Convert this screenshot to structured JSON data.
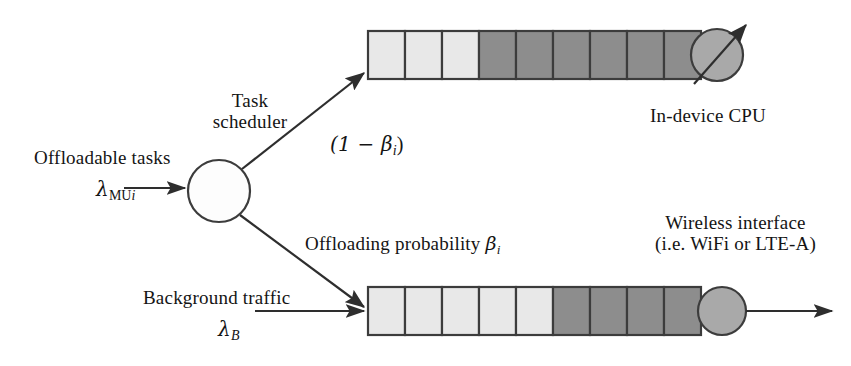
{
  "diagram": {
    "type": "queueing-system-block-diagram",
    "colors": {
      "stroke": "#3c3c3c",
      "light_cell": "#e6e6e6",
      "dark_cell": "#8c8c8c",
      "server_fill": "#a8a8a8",
      "scheduler_fill": "#fdfdfd",
      "background": "#ffffff",
      "text": "#141414"
    },
    "labels": {
      "task_scheduler_line1": "Task",
      "task_scheduler_line2": "scheduler",
      "offloadable_tasks": "Offloadable tasks",
      "lambda_mu_symbol": "λ",
      "lambda_mu_subscript": "MU",
      "lambda_mu_subscript_index": "i",
      "one_minus_beta": "(1 − β",
      "one_minus_beta_index": "i",
      "one_minus_beta_close": ")",
      "offloading_probability": "Offloading probability",
      "offloading_probability_symbol": "β",
      "offloading_probability_index": "i",
      "background_traffic": "Background traffic",
      "lambda_b_symbol": "λ",
      "lambda_b_subscript": "B",
      "in_device_cpu": "In-device CPU",
      "wireless_interface_line1": "Wireless interface",
      "wireless_interface_line2": "(i.e. WiFi or LTE-A)"
    },
    "nodes": {
      "scheduler": {
        "name": "task-scheduler",
        "shape": "circle",
        "cx": 219,
        "cy": 191,
        "r": 31,
        "filled": false
      },
      "cpu_server": {
        "name": "in-device-cpu-server",
        "shape": "circle",
        "cx": 717,
        "cy": 54,
        "r": 26,
        "filled": true
      },
      "wireless_server": {
        "name": "wireless-interface-server",
        "shape": "circle",
        "cx": 723,
        "cy": 312,
        "r": 24,
        "filled": true
      }
    },
    "queues": [
      {
        "name": "cpu-queue",
        "x": 368,
        "y": 31,
        "cell_width": 37,
        "cell_height": 48,
        "cells": [
          "light",
          "light",
          "light",
          "dark",
          "dark",
          "dark",
          "dark",
          "dark",
          "dark"
        ],
        "light_count": 3,
        "dark_count": 6,
        "total_cells": 9
      },
      {
        "name": "wireless-queue",
        "x": 368,
        "y": 287,
        "cell_width": 37,
        "cell_height": 48,
        "cells": [
          "light",
          "light",
          "light",
          "light",
          "light",
          "dark",
          "dark",
          "dark",
          "dark"
        ],
        "light_count": 5,
        "dark_count": 4,
        "total_cells": 9
      }
    ],
    "arrows": [
      {
        "name": "offloadable-tasks-inflow-arrow",
        "from": [
          125,
          188
        ],
        "to": [
          186,
          188
        ],
        "style": "straight-horizontal"
      },
      {
        "name": "to-cpu-queue-arrow",
        "from": [
          243,
          168
        ],
        "to": [
          362,
          74
        ],
        "style": "diagonal-up-right"
      },
      {
        "name": "to-wireless-queue-arrow",
        "from": [
          241,
          216
        ],
        "to": [
          362,
          307
        ],
        "style": "diagonal-down-right"
      },
      {
        "name": "background-traffic-inflow-arrow",
        "from": [
          256,
          311
        ],
        "to": [
          362,
          311
        ],
        "style": "straight-horizontal"
      },
      {
        "name": "cpu-service-arrow",
        "from": [
          692,
          84
        ],
        "to": [
          748,
          23
        ],
        "style": "diagonal-through-server"
      },
      {
        "name": "wireless-departure-arrow",
        "from": [
          748,
          312
        ],
        "to": [
          830,
          312
        ],
        "style": "straight-horizontal"
      }
    ]
  }
}
